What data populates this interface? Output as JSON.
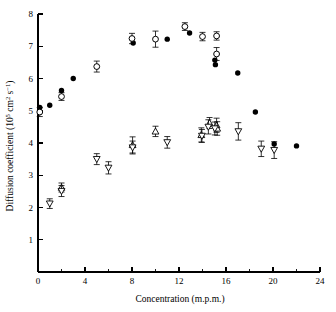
{
  "chart_data": {
    "type": "scatter",
    "title": "",
    "xlabel": "Concentration  (m.p.m.)",
    "ylabel": "Diffusion coefficient (10^5 cm^2 s^-1)",
    "ylabel_parts": {
      "main": "Diffusion coefficient (10",
      "sup1": "5",
      "mid": " cm",
      "sup2": "2",
      "mid2": " s",
      "sup3": "−1",
      "tail": ")"
    },
    "xlim": [
      0,
      24
    ],
    "ylim": [
      0,
      8
    ],
    "xticks": [
      0,
      4,
      8,
      12,
      16,
      20,
      24
    ],
    "xticklabels": [
      "0",
      "4",
      "8",
      "12",
      "16",
      "20",
      "24"
    ],
    "xticks_minor": [
      2,
      6,
      10,
      14,
      18,
      22
    ],
    "yticks": [
      1,
      2,
      3,
      4,
      5,
      6,
      7,
      8
    ],
    "yticklabels": [
      "1",
      "2",
      "3",
      "4",
      "5",
      "6",
      "7",
      "8"
    ],
    "grid": false,
    "legend": "none",
    "series": [
      {
        "name": "filled-circle",
        "marker": "filled-circle",
        "has_errorbars": false,
        "points": [
          {
            "x": 0.15,
            "y": 5.1
          },
          {
            "x": 1.0,
            "y": 5.17
          },
          {
            "x": 2.0,
            "y": 5.63
          },
          {
            "x": 3.0,
            "y": 6.0
          },
          {
            "x": 8.1,
            "y": 7.1
          },
          {
            "x": 11.0,
            "y": 7.22
          },
          {
            "x": 12.9,
            "y": 7.41
          },
          {
            "x": 15.05,
            "y": 6.57
          },
          {
            "x": 15.1,
            "y": 6.43
          },
          {
            "x": 17.0,
            "y": 6.17
          },
          {
            "x": 18.5,
            "y": 4.96
          },
          {
            "x": 20.1,
            "y": 3.97
          },
          {
            "x": 22.0,
            "y": 3.91
          }
        ]
      },
      {
        "name": "open-circle",
        "marker": "open-circle",
        "has_errorbars": true,
        "points": [
          {
            "x": 0.15,
            "y": 4.96,
            "err": 0.14
          },
          {
            "x": 2.0,
            "y": 5.44,
            "err": 0.12
          },
          {
            "x": 5.0,
            "y": 6.37,
            "err": 0.17
          },
          {
            "x": 8.0,
            "y": 7.24,
            "err": 0.16
          },
          {
            "x": 10.0,
            "y": 7.22,
            "err": 0.25
          },
          {
            "x": 12.5,
            "y": 7.61,
            "err": 0.12
          },
          {
            "x": 14.0,
            "y": 7.3,
            "err": 0.13
          },
          {
            "x": 15.2,
            "y": 7.32,
            "err": 0.13
          },
          {
            "x": 15.2,
            "y": 6.76,
            "err": 0.2
          }
        ]
      },
      {
        "name": "open-triangle-up",
        "marker": "triangle-up",
        "has_errorbars": true,
        "points": [
          {
            "x": 2.0,
            "y": 2.62,
            "err": 0.14
          },
          {
            "x": 8.05,
            "y": 3.94,
            "err": 0.25
          },
          {
            "x": 10.0,
            "y": 4.36,
            "err": 0.16
          },
          {
            "x": 13.9,
            "y": 4.25,
            "err": 0.22
          },
          {
            "x": 14.6,
            "y": 4.62,
            "err": 0.17
          },
          {
            "x": 15.2,
            "y": 4.55,
            "err": 0.22
          },
          {
            "x": 15.25,
            "y": 4.45,
            "err": 0.21
          }
        ]
      },
      {
        "name": "open-triangle-down",
        "marker": "triangle-down",
        "has_errorbars": true,
        "points": [
          {
            "x": 1.0,
            "y": 2.12,
            "err": 0.15
          },
          {
            "x": 2.0,
            "y": 2.51,
            "err": 0.17
          },
          {
            "x": 5.0,
            "y": 3.5,
            "err": 0.17
          },
          {
            "x": 6.0,
            "y": 3.23,
            "err": 0.19
          },
          {
            "x": 8.05,
            "y": 3.86,
            "err": 0.2
          },
          {
            "x": 11.0,
            "y": 4.02,
            "err": 0.18
          },
          {
            "x": 13.95,
            "y": 4.22,
            "err": 0.2
          },
          {
            "x": 14.5,
            "y": 4.5,
            "err": 0.22
          },
          {
            "x": 15.05,
            "y": 4.45,
            "err": 0.2
          },
          {
            "x": 17.05,
            "y": 4.36,
            "err": 0.27
          },
          {
            "x": 19.0,
            "y": 3.82,
            "err": 0.24
          },
          {
            "x": 20.1,
            "y": 3.78,
            "err": 0.26
          }
        ]
      }
    ]
  }
}
